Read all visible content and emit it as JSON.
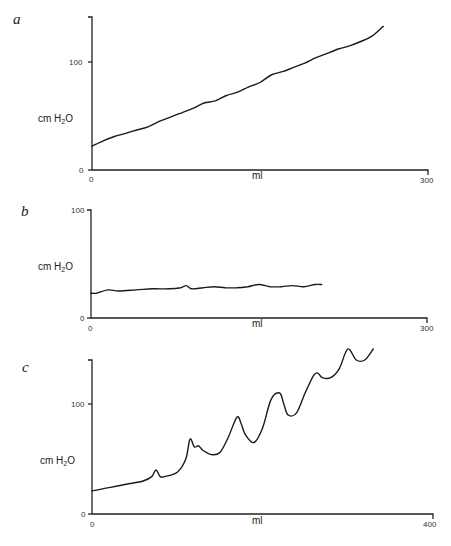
{
  "chart_data": [
    {
      "panel": "a",
      "type": "line",
      "title": "",
      "xlabel": "ml",
      "ylabel": "cm H2O",
      "xlim": [
        0,
        300
      ],
      "ylim": [
        0,
        140
      ],
      "x_ticks": [
        "0",
        "300"
      ],
      "y_ticks": [
        "0",
        "100"
      ],
      "grid": false,
      "series": [
        {
          "name": "pressure",
          "x": [
            0,
            10,
            20,
            30,
            40,
            50,
            60,
            70,
            80,
            90,
            100,
            110,
            120,
            130,
            140,
            150,
            160,
            170,
            180,
            190,
            200,
            210,
            220,
            230,
            240,
            250,
            260
          ],
          "y": [
            22,
            27,
            31,
            34,
            37,
            40,
            45,
            49,
            53,
            57,
            62,
            64,
            69,
            72,
            77,
            81,
            88,
            91,
            95,
            99,
            104,
            108,
            112,
            115,
            119,
            124,
            133
          ]
        }
      ],
      "layout": {
        "x0": 92,
        "x1": 428,
        "y0": 170,
        "y100": 62,
        "ytop": 17
      }
    },
    {
      "panel": "b",
      "type": "line",
      "title": "",
      "xlabel": "ml",
      "ylabel": "cm H2O",
      "xlim": [
        0,
        300
      ],
      "ylim": [
        0,
        100
      ],
      "x_ticks": [
        "0",
        "300"
      ],
      "y_ticks": [
        "0",
        "100"
      ],
      "grid": false,
      "series": [
        {
          "name": "pressure",
          "x": [
            0,
            5,
            15,
            25,
            40,
            55,
            70,
            80,
            85,
            90,
            100,
            110,
            120,
            130,
            140,
            150,
            160,
            170,
            180,
            190,
            200,
            206
          ],
          "y": [
            23,
            23,
            26,
            25,
            26,
            27,
            27,
            28,
            30,
            27,
            28,
            29,
            28,
            28,
            29,
            31,
            29,
            29,
            30,
            29,
            31,
            31
          ]
        }
      ],
      "layout": {
        "x0": 91,
        "x1": 427,
        "y0": 318,
        "y100": 210,
        "ytop": 210
      }
    },
    {
      "panel": "c",
      "type": "line",
      "title": "",
      "xlabel": "ml",
      "ylabel": "cm H2O",
      "xlim": [
        0,
        400
      ],
      "ylim": [
        0,
        140
      ],
      "x_ticks": [
        "0",
        "400"
      ],
      "y_ticks": [
        "0",
        "100"
      ],
      "grid": false,
      "series": [
        {
          "name": "pressure",
          "x": [
            0,
            20,
            40,
            60,
            70,
            75,
            80,
            85,
            100,
            110,
            115,
            120,
            125,
            130,
            140,
            150,
            160,
            170,
            175,
            180,
            190,
            200,
            210,
            220,
            225,
            230,
            240,
            250,
            260,
            265,
            270,
            280,
            290,
            300,
            310,
            320,
            330
          ],
          "y": [
            21,
            24,
            27,
            30,
            34,
            40,
            34,
            34,
            38,
            50,
            68,
            61,
            62,
            58,
            54,
            56,
            70,
            88,
            82,
            72,
            65,
            78,
            104,
            110,
            100,
            90,
            92,
            110,
            126,
            128,
            124,
            124,
            132,
            150,
            140,
            140,
            150
          ]
        }
      ],
      "layout": {
        "x0": 92,
        "x1": 433,
        "y0": 514,
        "y100": 404,
        "ytop": 360
      }
    }
  ],
  "panels": [
    {
      "letter": "a",
      "ylabel": "cm H",
      "ylabel_sub": "2",
      "ylabel_end": "O",
      "xlabel": "ml",
      "y0": "0",
      "y100": "100",
      "x0": "0",
      "xmax": "300"
    },
    {
      "letter": "b",
      "ylabel": "cm H",
      "ylabel_sub": "2",
      "ylabel_end": "O",
      "xlabel": "ml",
      "y0": "0",
      "y100": "100",
      "x0": "0",
      "xmax": "300"
    },
    {
      "letter": "c",
      "ylabel": "cm H",
      "ylabel_sub": "2",
      "ylabel_end": "O",
      "xlabel": "ml",
      "y0": "0",
      "y100": "100",
      "x0": "0",
      "xmax": "400"
    }
  ]
}
